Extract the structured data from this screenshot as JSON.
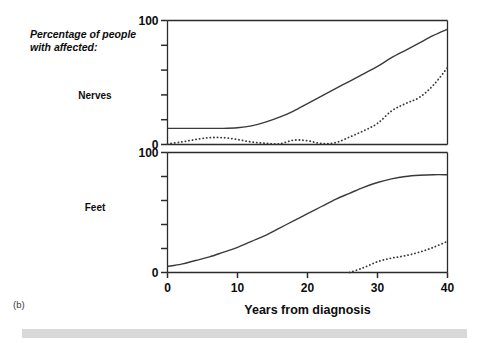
{
  "figure": {
    "caption": "(b)",
    "axis_title_line1": "Percentage of people",
    "axis_title_line2": "with affected:",
    "xlabel": "Years from diagnosis"
  },
  "panels": [
    {
      "key": "nerves",
      "label": "Nerves"
    },
    {
      "key": "feet",
      "label": "Feet"
    }
  ],
  "ticks": {
    "x": [
      "0",
      "10",
      "20",
      "30",
      "40"
    ],
    "y_top": [
      "0",
      "100"
    ],
    "y_bottom": [
      "0",
      "100"
    ]
  },
  "colors": {
    "axis": "#2b2b2b",
    "curve": "#3a3a3a",
    "footer": "#d9d9d9",
    "text": "#0d0d0d"
  },
  "chart_data": {
    "type": "line",
    "title": "",
    "subtitle": "",
    "xlabel": "Years from diagnosis",
    "ylabel": "Percentage of people with affected:",
    "xlim": [
      0,
      40
    ],
    "ylim": [
      0,
      100
    ],
    "xticks": [
      0,
      10,
      20,
      30,
      40
    ],
    "yticks": [
      0,
      20,
      40,
      60,
      80,
      100
    ],
    "ytick_labels_shown": [
      0,
      100
    ],
    "grid": false,
    "legend": "none",
    "panels": [
      {
        "name": "Nerves",
        "x": [
          0,
          2,
          4,
          6,
          8,
          10,
          12,
          14,
          16,
          18,
          20,
          22,
          24,
          26,
          28,
          30,
          32,
          34,
          36,
          38,
          40
        ],
        "series": [
          {
            "name": "solid",
            "style": "solid",
            "values": [
              13,
              13,
              13,
              13,
              13,
              13.5,
              15,
              18,
              22,
              27,
              33,
              39,
              45,
              51,
              57,
              63,
              70,
              76,
              82,
              88,
              93
            ]
          },
          {
            "name": "dashed",
            "style": "dashed",
            "values": [
              0.5,
              2,
              4,
              5.5,
              5.5,
              4,
              2,
              1,
              0.5,
              3.5,
              3,
              0.8,
              1.5,
              6,
              11,
              17,
              27,
              33,
              38,
              48,
              62
            ]
          }
        ]
      },
      {
        "name": "Feet",
        "x": [
          0,
          2,
          4,
          6,
          8,
          10,
          12,
          14,
          16,
          18,
          20,
          22,
          24,
          26,
          28,
          30,
          32,
          34,
          36,
          38,
          40
        ],
        "series": [
          {
            "name": "solid",
            "style": "solid",
            "values": [
              5,
              7,
              10,
              13,
              17,
              21,
              26,
              31,
              37,
              43,
              49,
              55,
              61,
              66,
              71,
              75,
              78,
              80,
              81,
              81.5,
              81.5
            ]
          },
          {
            "name": "dashed",
            "style": "dashed",
            "values": [
              null,
              null,
              null,
              null,
              null,
              null,
              null,
              null,
              null,
              null,
              null,
              null,
              null,
              0,
              4,
              9,
              12,
              14,
              17,
              21,
              26
            ]
          }
        ]
      }
    ]
  }
}
